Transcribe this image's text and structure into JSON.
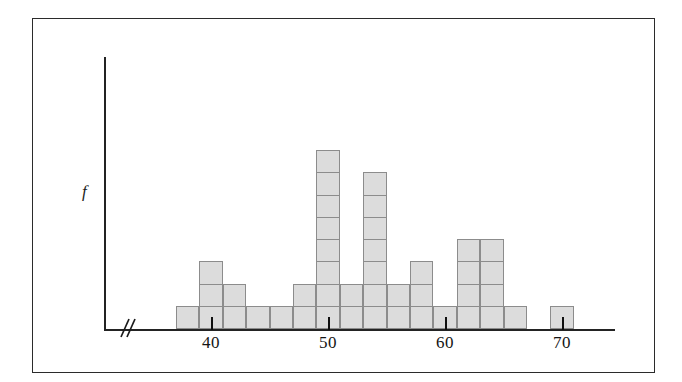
{
  "figure": {
    "background_color": "#ffffff",
    "frame_color": "#2b2b2b",
    "axis_color": "#232323"
  },
  "axes": {
    "y_label": "f",
    "x_tick_labels": [
      "40",
      "50",
      "60",
      "70"
    ],
    "x_tick_values": [
      40,
      50,
      60,
      70
    ],
    "axis_break_symbol": "//"
  },
  "chart_data": {
    "type": "bar",
    "title": "",
    "subtitle": "",
    "xlabel": "",
    "ylabel": "f",
    "grid": false,
    "legend": "none",
    "note": "Dotplot-style histogram built from unit square cells; each cell = 1 observation. Bin width = 2 units. x axis has a break between the origin and 38.",
    "bin_width": 2,
    "cell_unit": 1,
    "xlim": [
      38,
      72
    ],
    "ylim": [
      0,
      8
    ],
    "categories": [
      "38-40",
      "40-42",
      "42-44",
      "44-46",
      "46-48",
      "48-50",
      "50-52",
      "52-54",
      "54-56",
      "56-58",
      "58-60",
      "60-62",
      "62-64",
      "64-66",
      "66-68",
      "68-70",
      "70-72"
    ],
    "bin_starts": [
      38,
      40,
      42,
      44,
      46,
      48,
      50,
      52,
      54,
      56,
      58,
      60,
      62,
      64,
      66,
      68,
      70
    ],
    "values": [
      1,
      3,
      2,
      1,
      1,
      2,
      8,
      2,
      7,
      2,
      3,
      1,
      4,
      4,
      1,
      0,
      1
    ],
    "x": [
      39,
      41,
      43,
      45,
      47,
      49,
      51,
      53,
      55,
      57,
      59,
      61,
      63,
      65,
      67,
      69,
      71
    ],
    "bar_fill": "#dcdcdc",
    "bar_edge": "#8c8c8c",
    "total_count": 43
  }
}
